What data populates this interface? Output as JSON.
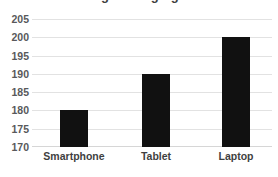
{
  "chart_data": {
    "type": "bar",
    "title": "Average Charging Time",
    "title_note": "cropped at top edge of screenshot",
    "categories": [
      "Smartphone",
      "Tablet",
      "Laptop"
    ],
    "values": [
      180,
      190,
      200
    ],
    "xlabel": "",
    "ylabel": "",
    "ylim": [
      170,
      205
    ],
    "ytick_step": 5,
    "yticks": [
      "205",
      "200",
      "195",
      "190",
      "185",
      "180",
      "175",
      "170"
    ],
    "grid": true,
    "legend": false,
    "bar_color": "#111111",
    "gridline_color": "#e2e2e2",
    "label_color": "#3f3f3f"
  }
}
